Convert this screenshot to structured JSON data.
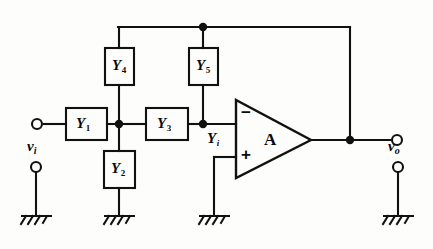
{
  "figure": {
    "kind": "circuit-schematic",
    "stroke_color": "#111111",
    "background_color": "#fdfdfb"
  },
  "components": {
    "admittances": [
      {
        "id": "Y1",
        "symbol": "Y",
        "subscript": "1",
        "orientation": "horizontal"
      },
      {
        "id": "Y2",
        "symbol": "Y",
        "subscript": "2",
        "orientation": "vertical"
      },
      {
        "id": "Y3",
        "symbol": "Y",
        "subscript": "3",
        "orientation": "horizontal"
      },
      {
        "id": "Y4",
        "symbol": "Y",
        "subscript": "4",
        "orientation": "vertical"
      },
      {
        "id": "Y5",
        "symbol": "Y",
        "subscript": "5",
        "orientation": "vertical"
      }
    ],
    "amplifier": {
      "label": "A",
      "inverting_input_sign": "−",
      "noninverting_input_sign": "+"
    },
    "node_labels": [
      {
        "id": "Yi",
        "symbol": "Y",
        "subscript": "i"
      }
    ]
  },
  "terminals": {
    "input": {
      "symbol": "v",
      "subscript": "i"
    },
    "output": {
      "symbol": "v",
      "subscript": "o"
    }
  },
  "grounds": [
    {
      "id": "ground-input"
    },
    {
      "id": "ground-y2"
    },
    {
      "id": "ground-noninverting"
    },
    {
      "id": "ground-output"
    }
  ]
}
